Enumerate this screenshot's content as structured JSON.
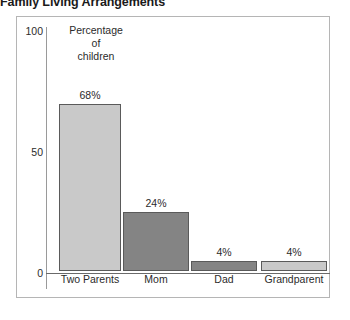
{
  "title": "Family Living Arrangements",
  "axis_caption_lines": [
    "Percentage",
    "of",
    "children"
  ],
  "chart_data": {
    "type": "bar",
    "title": "Family Living Arrangements",
    "categories": [
      "Two Parents",
      "Mom",
      "Dad",
      "Grandparent"
    ],
    "values": [
      68,
      24,
      4,
      4
    ],
    "value_labels": [
      "68%",
      "24%",
      "4%",
      "4%"
    ],
    "bar_colors": [
      "#c9c9c9",
      "#848484",
      "#848484",
      "#c9c9c9"
    ],
    "bar_border_color": "#5a5a5a",
    "xlabel": "",
    "ylabel": "Percentage of children",
    "ylim": [
      0,
      100
    ],
    "yticks": [
      0,
      50,
      100
    ],
    "ytick_labels": [
      "0",
      "50",
      "100"
    ],
    "grid": false,
    "legend": false
  }
}
